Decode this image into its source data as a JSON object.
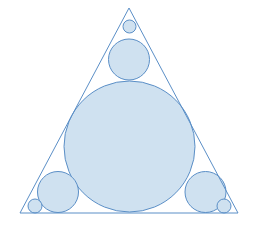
{
  "figure": {
    "name": "circle-packing-in-equilateral-triangle",
    "kind": "geometric-diagram",
    "title": "",
    "caption": "",
    "background_color": "#ffffff",
    "stroke_color": "#5b8fc7",
    "fill_color": "#cfe1f0",
    "stroke_width": 1,
    "canvas": {
      "width": 257,
      "height": 227
    }
  },
  "chart_data": {
    "type": "scatter",
    "title": "",
    "xlabel": "",
    "ylabel": "",
    "xlim": [
      0,
      257
    ],
    "ylim": [
      0,
      227
    ],
    "grid": false,
    "legend": "none",
    "shapes": {
      "triangle": {
        "label": "equilateral-triangle",
        "points": [
          {
            "name": "apex",
            "x": 129,
            "y": 8
          },
          {
            "name": "bottom-right",
            "x": 238,
            "y": 213
          },
          {
            "name": "bottom-left",
            "x": 20,
            "y": 213
          }
        ],
        "stroke": "#5b8fc7",
        "fill": "none"
      },
      "circles": [
        {
          "label": "incircle-large",
          "cx": 129.5,
          "cy": 146.5,
          "r": 65.5,
          "stroke": "#5b8fc7",
          "fill": "#cfe1f0"
        },
        {
          "label": "apex-medium-circle",
          "cx": 129,
          "cy": 59.5,
          "r": 20.5,
          "stroke": "#5b8fc7",
          "fill": "#cfe1f0"
        },
        {
          "label": "bottom-left-medium-circle",
          "cx": 58,
          "cy": 192,
          "r": 20.5,
          "stroke": "#5b8fc7",
          "fill": "#cfe1f0"
        },
        {
          "label": "bottom-right-medium-circle",
          "cx": 205.5,
          "cy": 192,
          "r": 20.5,
          "stroke": "#5b8fc7",
          "fill": "#cfe1f0"
        },
        {
          "label": "apex-tiny-circle",
          "cx": 129.5,
          "cy": 26.5,
          "r": 6.5,
          "stroke": "#5b8fc7",
          "fill": "#cfe1f0"
        },
        {
          "label": "bottom-left-tiny-circle",
          "cx": 35,
          "cy": 206,
          "r": 7,
          "stroke": "#5b8fc7",
          "fill": "#cfe1f0"
        },
        {
          "label": "bottom-right-tiny-circle",
          "cx": 224,
          "cy": 206,
          "r": 7,
          "stroke": "#5b8fc7",
          "fill": "#cfe1f0"
        }
      ]
    },
    "counts": {
      "triangles": 1,
      "circles": 7,
      "large_circles": 1,
      "medium_circles": 3,
      "small_circles": 3
    }
  }
}
